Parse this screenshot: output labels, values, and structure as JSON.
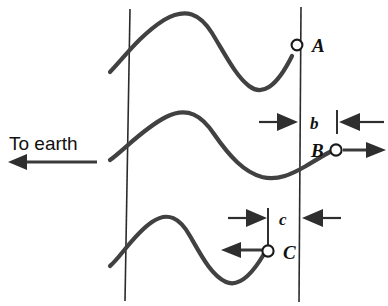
{
  "figure": {
    "background_color": "#ffffff",
    "wave_color": "#414141",
    "line_color": "#2b2b2b",
    "text_color": "#111111"
  },
  "caption": {
    "direction_label": "To earth"
  },
  "points": [
    {
      "id": "A",
      "label": "A"
    },
    {
      "id": "B",
      "label": "B"
    },
    {
      "id": "C",
      "label": "C"
    }
  ],
  "dimensions": [
    {
      "id": "b",
      "label": "b"
    },
    {
      "id": "c",
      "label": "c"
    }
  ],
  "icons": {
    "direction_arrow": "arrow-left-icon",
    "b_left_arrow": "arrow-right-icon",
    "b_right_arrow": "arrow-left-icon",
    "c_left_arrow": "arrow-right-icon",
    "c_right_arrow": "arrow-left-icon",
    "point_b_arrow": "arrow-right-icon",
    "point_c_arrow": "arrow-left-icon"
  }
}
